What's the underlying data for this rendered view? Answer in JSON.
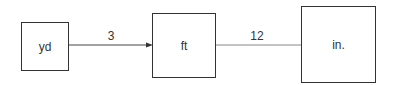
{
  "diagram": {
    "nodes": [
      {
        "id": "yd",
        "label": "yd"
      },
      {
        "id": "ft",
        "label": "ft"
      },
      {
        "id": "in",
        "label": "in."
      }
    ],
    "edges": [
      {
        "from": "yd",
        "to": "ft",
        "label": "3",
        "arrow": true
      },
      {
        "from": "ft",
        "to": "in",
        "label": "12",
        "arrow": false
      }
    ]
  }
}
